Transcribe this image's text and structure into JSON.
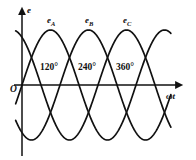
{
  "figure": {
    "background": "#ffffff",
    "stroke_color": "#111111"
  },
  "axes": {
    "y_label": "e",
    "x_label": "ωt",
    "origin_label": "O",
    "x_axis_y_px": 85,
    "y_axis_x_px": 22
  },
  "curve_labels": [
    {
      "name": "e",
      "sub": "A",
      "x_px": 47,
      "y_px": 16
    },
    {
      "name": "e",
      "sub": "B",
      "x_px": 85,
      "y_px": 16
    },
    {
      "name": "e",
      "sub": "C",
      "x_px": 123,
      "y_px": 16
    }
  ],
  "angle_labels": [
    {
      "text": "120°",
      "x_px": 40,
      "y_px": 63
    },
    {
      "text": "240°",
      "x_px": 78,
      "y_px": 63
    },
    {
      "text": "360°",
      "x_px": 116,
      "y_px": 63
    }
  ],
  "chart_data": {
    "type": "line",
    "title": "",
    "xlabel": "ωt",
    "ylabel": "e",
    "grid": false,
    "legend": "inline-curve-labels",
    "x_unit": "degrees",
    "x_range_deg": [
      -30,
      500
    ],
    "ylim": [
      -1.15,
      1.15
    ],
    "amplitude": 1.0,
    "period_deg": 360,
    "tick_labels_deg": [
      120,
      240,
      360
    ],
    "series": [
      {
        "name": "e_A",
        "label": "eA",
        "phase_deg": 0,
        "formula": "sin(wt)"
      },
      {
        "name": "e_B",
        "label": "eB",
        "phase_deg": -120,
        "formula": "sin(wt - 120)"
      },
      {
        "name": "e_C",
        "label": "eC",
        "phase_deg": -240,
        "formula": "sin(wt - 240)"
      }
    ],
    "geometry": {
      "x0_px": 22,
      "y0_px": 85,
      "px_per_deg": 0.3167,
      "amp_px": 55,
      "x_end_px": 182,
      "curve_start_deg": -20,
      "curve_end_deg": 470,
      "phase_shift_px": 38
    }
  }
}
